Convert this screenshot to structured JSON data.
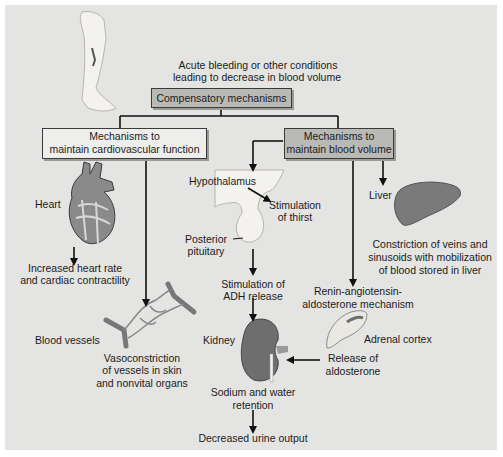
{
  "diagram": {
    "trigger": {
      "line1": "Acute bleeding or other conditions",
      "line2": "leading to decrease in blood volume"
    },
    "root": {
      "label": "Compensatory mechanisms"
    },
    "cardio_branch": {
      "box": {
        "line1": "Mechanisms to",
        "line2": "maintain cardiovascular function"
      },
      "heart": {
        "label": "Heart",
        "effect_line1": "Increased heart rate",
        "effect_line2": "and cardiac contractility"
      },
      "vessels": {
        "label": "Blood vessels",
        "effect_line1": "Vasoconstriction",
        "effect_line2": "of vessels in skin",
        "effect_line3": "and nonvital organs"
      }
    },
    "volume_branch": {
      "box": {
        "line1": "Mechanisms to",
        "line2": "maintain blood volume"
      },
      "hypothalamus": {
        "label": "Hypothalamus",
        "thirst_line1": "Stimulation",
        "thirst_line2": "of thirst",
        "pituitary_line1": "Posterior",
        "pituitary_line2": "pituitary",
        "adh_line1": "Stimulation of",
        "adh_line2": "ADH release"
      },
      "liver": {
        "label": "Liver",
        "effect_line1": "Constriction of veins and",
        "effect_line2": "sinusoids with mobilization",
        "effect_line3": "of blood stored in liver"
      },
      "raas": {
        "line1": "Renin-angiotensin-",
        "line2": "aldosterone mechanism",
        "adrenal_label": "Adrenal cortex",
        "release_line1": "Release of",
        "release_line2": "aldosterone"
      },
      "kidney": {
        "label": "Kidney",
        "effect_line1": "Sodium and water",
        "effect_line2": "retention",
        "outcome": "Decreased urine output"
      }
    },
    "colors": {
      "panel_bg": "#e4e4e2",
      "box_light": "#eeeeec",
      "box_dark": "#b9b9b6",
      "line": "#111111",
      "organ_dark": "#6e6e6e"
    }
  }
}
